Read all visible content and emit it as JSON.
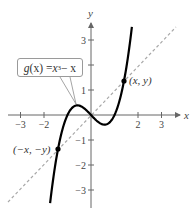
{
  "chart_data": {
    "type": "line",
    "title": "",
    "xlabel": "x",
    "ylabel": "y",
    "xlim": [
      -3.6,
      3.8
    ],
    "ylim": [
      -3.6,
      3.7
    ],
    "grid": false,
    "x_ticks": [
      -3,
      -2,
      2,
      3
    ],
    "x_tick_labels": [
      "−3",
      "−2",
      "2",
      "3"
    ],
    "y_ticks": [
      3,
      1,
      -1,
      -2,
      -3
    ],
    "y_tick_labels": [
      "3",
      "1",
      "−1",
      "−2",
      "−3"
    ],
    "y_tick_marks": [
      3,
      2,
      1,
      -1,
      -2,
      -3
    ],
    "series": [
      {
        "name": "g(x) = x^3 − x",
        "style": "solid",
        "color": "#000000",
        "function": "x^3 - x",
        "domain": [
          -1.74,
          1.74
        ]
      },
      {
        "name": "y = x",
        "style": "dashed",
        "color": "#a0a0a0",
        "function": "x",
        "domain": [
          -3.5,
          3.6
        ]
      }
    ],
    "points": [
      {
        "label": "(x, y)",
        "x": 1.4,
        "y": 1.344
      },
      {
        "label": "(−x, −y)",
        "x": -1.4,
        "y": -1.344
      }
    ],
    "annotations": [
      {
        "text": "g(x) = x³ − x",
        "type": "callout",
        "points_to": [
          -0.6,
          0.4
        ]
      }
    ]
  },
  "labels": {
    "x_axis": "x",
    "y_axis": "y",
    "point_pos": "(x, y)",
    "point_neg": "(−x, −y)",
    "fn_g": "g",
    "fn_paren": "(x) = ",
    "fn_x": "x",
    "fn_exp": "3",
    "fn_tail": " − x"
  },
  "colors": {
    "curve": "#000000",
    "dashed": "#a0a0a0",
    "axis": "#666666"
  }
}
